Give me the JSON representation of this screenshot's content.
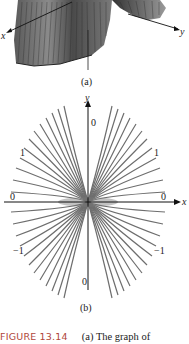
{
  "figure": {
    "number_label": "FIGURE 13.14",
    "caption_text": "(a) The graph of",
    "panel_a": {
      "label": "(a)",
      "axis_labels": {
        "x": "x",
        "y": "y"
      },
      "description": "3D surface plot with dense vertical ruling lines, grayscale"
    },
    "panel_b": {
      "label": "(b)",
      "axis_labels": {
        "x": "x",
        "y": "y"
      },
      "level_labels": {
        "top": "0",
        "bottom": "0",
        "upper_left": "1",
        "upper_right": "1",
        "left": "0",
        "right": "0",
        "lower_left": "−1",
        "lower_right": "−1"
      },
      "description": "Contour plot: fan of curves through origin, concave toward y-axis"
    }
  },
  "colors": {
    "caption_label": "#b0463a",
    "contour": "#6e6e6e",
    "axis": "#111111"
  }
}
